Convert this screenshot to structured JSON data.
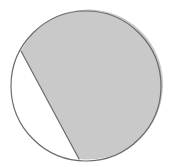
{
  "figure": {
    "name": "circle-with-shaded-segment",
    "background_color": "#ffffff",
    "canvas": {
      "width": 173,
      "height": 167
    },
    "stroke": {
      "color": "#6a6a6a",
      "width": 1.2
    },
    "circle": {
      "center_x": 86,
      "center_y": 86,
      "radius": 75,
      "fill": "none"
    },
    "chord": {
      "start_x": 21,
      "start_y": 51,
      "end_x": 79,
      "end_y": 159
    },
    "shaded_region": {
      "label": "major-segment",
      "fill": "#c9c9c9",
      "path": "M 21 51 L 79 159 A 75 75 0 1 0 21 51 Z"
    },
    "unshaded_region": {
      "label": "minor-segment",
      "fill": "#ffffff",
      "path": "M 21 51 A 75 75 0 0 0 79 159 Z"
    }
  }
}
